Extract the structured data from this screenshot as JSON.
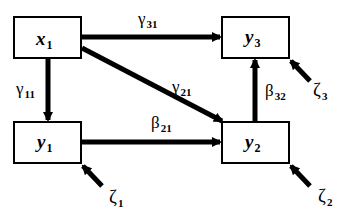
{
  "diagram": {
    "type": "path-diagram",
    "colors": {
      "stroke": "#000000",
      "background": "#ffffff"
    },
    "nodes": [
      {
        "id": "x1",
        "symbol": "x",
        "sub": "1"
      },
      {
        "id": "y1",
        "symbol": "y",
        "sub": "1"
      },
      {
        "id": "y2",
        "symbol": "y",
        "sub": "2"
      },
      {
        "id": "y3",
        "symbol": "y",
        "sub": "3"
      }
    ],
    "edges": [
      {
        "from": "x1",
        "to": "y3",
        "symbol": "γ",
        "sub": "31"
      },
      {
        "from": "x1",
        "to": "y1",
        "symbol": "γ",
        "sub": "11"
      },
      {
        "from": "x1",
        "to": "y2",
        "symbol": "γ",
        "sub": "21"
      },
      {
        "from": "y1",
        "to": "y2",
        "symbol": "β",
        "sub": "21"
      },
      {
        "from": "y2",
        "to": "y3",
        "symbol": "β",
        "sub": "32"
      }
    ],
    "disturbances": [
      {
        "target": "y1",
        "symbol": "ζ",
        "sub": "1"
      },
      {
        "target": "y2",
        "symbol": "ζ",
        "sub": "2"
      },
      {
        "target": "y3",
        "symbol": "ζ",
        "sub": "3"
      }
    ]
  }
}
